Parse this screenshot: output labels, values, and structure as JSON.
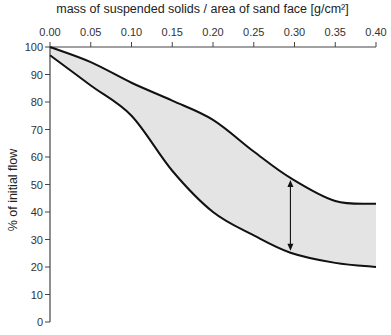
{
  "chart_data": {
    "type": "area",
    "title": "mass of suspended solids / area of sand face [g/cm²]",
    "xlabel": "mass of suspended solids / area of sand face [g/cm²]",
    "ylabel": "% of initial flow",
    "xaxis_position": "top",
    "xlim": [
      0.0,
      0.4
    ],
    "ylim": [
      0,
      100
    ],
    "x_ticks": [
      "0.00",
      "0.05",
      "0.10",
      "0.15",
      "0.20",
      "0.25",
      "0.30",
      "0.35",
      "0.40"
    ],
    "y_ticks": [
      "0",
      "10",
      "20",
      "30",
      "40",
      "50",
      "60",
      "70",
      "80",
      "90",
      "100"
    ],
    "grid": false,
    "legend": null,
    "fill_color": "#e4e4e4",
    "line_color": "#111111",
    "series": [
      {
        "name": "upper bound",
        "x": [
          0.0,
          0.05,
          0.1,
          0.15,
          0.2,
          0.25,
          0.295,
          0.35,
          0.4
        ],
        "values": [
          100,
          94.5,
          87,
          80.5,
          73.5,
          62,
          52.4,
          44,
          43
        ]
      },
      {
        "name": "lower bound",
        "x": [
          0.0,
          0.05,
          0.1,
          0.15,
          0.2,
          0.25,
          0.295,
          0.35,
          0.4
        ],
        "values": [
          97,
          86,
          75,
          55,
          40,
          31.5,
          25.2,
          21.5,
          20
        ]
      }
    ],
    "annotations": [
      {
        "type": "double-arrow",
        "x": 0.295,
        "y_from": 52.4,
        "y_to": 25.2
      }
    ]
  }
}
